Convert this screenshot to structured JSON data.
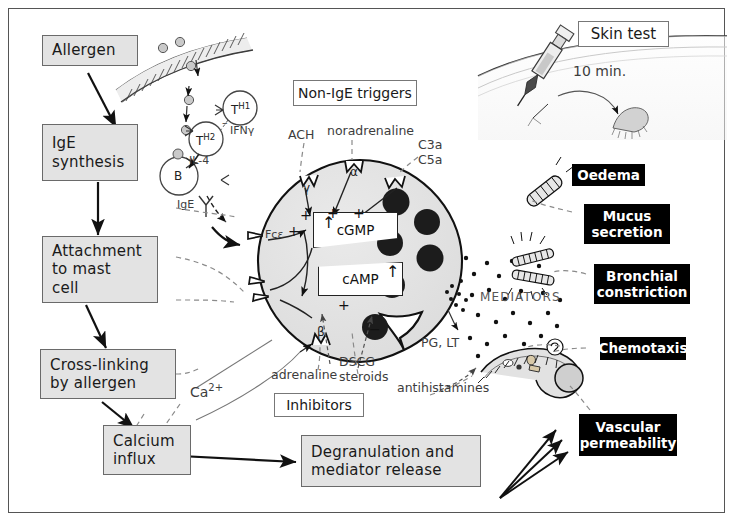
{
  "pathway_boxes": [
    {
      "name": "allergen",
      "lines": [
        "Allergen"
      ]
    },
    {
      "name": "ige-synthesis",
      "lines": [
        "IgE",
        "synthesis"
      ]
    },
    {
      "name": "attachment",
      "lines": [
        "Attachment",
        "to mast",
        "cell"
      ]
    },
    {
      "name": "cross-linking",
      "lines": [
        "Cross-linking",
        "by allergen"
      ]
    },
    {
      "name": "calcium-influx",
      "lines": [
        "Calcium",
        "influx"
      ]
    },
    {
      "name": "degranulation",
      "lines": [
        "Degranulation and",
        "mediator release"
      ]
    }
  ],
  "outline_boxes": [
    {
      "name": "non-ige-triggers",
      "label": "Non-IgE triggers"
    },
    {
      "name": "skin-test",
      "label": "Skin test"
    },
    {
      "name": "inhibitors",
      "label": "Inhibitors"
    }
  ],
  "effects": [
    {
      "name": "oedema",
      "lines": [
        "Oedema"
      ]
    },
    {
      "name": "mucus-secretion",
      "lines": [
        "Mucus",
        "secretion"
      ]
    },
    {
      "name": "bronchial-constriction",
      "lines": [
        "Bronchial",
        "constriction"
      ]
    },
    {
      "name": "chemotaxis",
      "lines": [
        "Chemotaxis"
      ]
    },
    {
      "name": "vascular-permeability",
      "lines": [
        "Vascular",
        "permeability"
      ]
    }
  ],
  "immune_cells": {
    "th1": "T",
    "th1_sup": "H1",
    "th2": "T",
    "th2_sup": "H2",
    "bcell": "B",
    "ifng": "IFNγ",
    "il4": "IL-4",
    "ige": "IgE"
  },
  "receptors": {
    "fce": "Fcε",
    "gamma": "γ",
    "alpha": "α",
    "beta": "β"
  },
  "stimuli": {
    "ach": "ACH",
    "noradrenaline": "noradrenaline",
    "c3a": "C3a",
    "c5a": "C5a"
  },
  "second_messengers": {
    "cgmp": "cGMP",
    "camp": "cAMP",
    "up_arrow": "↑"
  },
  "inhibitor_agents": {
    "adrenaline": "adrenaline",
    "dscg": "DSCG",
    "steroids": "steroids",
    "antihistamines": "antihistamines"
  },
  "mediator_labels": {
    "mediators": "MEDIATORS",
    "pg_lt": "PG, LT",
    "calcium": "Ca",
    "calcium_charge": "2+"
  },
  "skin_test": {
    "timer": "10 min."
  },
  "signs": {
    "plus": "+",
    "minus": "−"
  },
  "colors": {
    "box_fill": "#e3e3e3",
    "box_border": "#6a6a6a",
    "effect_bg": "#000000",
    "effect_text": "#ffffff",
    "cell_fill": "#e0e0e0",
    "granule_fill": "#1c1c1c",
    "ink": "#1a1a1a"
  }
}
